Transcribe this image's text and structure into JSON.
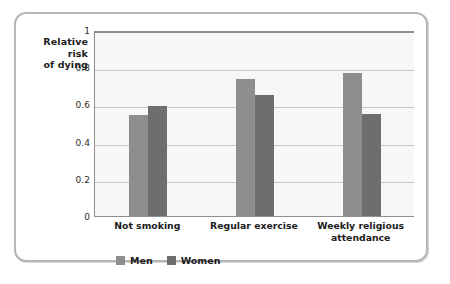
{
  "chart_data": {
    "type": "bar",
    "title": "",
    "xlabel": "",
    "ylabel": "Relative risk of dying",
    "ylabel_lines": [
      "Relative",
      "risk",
      "of dying"
    ],
    "categories": [
      "Not smoking",
      "Regular exercise",
      "Weekly religious attendance"
    ],
    "category_label_lines": [
      [
        "Not smoking"
      ],
      [
        "Regular exercise"
      ],
      [
        "Weekly religious",
        "attendance"
      ]
    ],
    "series": [
      {
        "name": "Men",
        "color": "#8e8e8e",
        "values": [
          0.545,
          0.735,
          0.77
        ]
      },
      {
        "name": "Women",
        "color": "#6e6e6e",
        "values": [
          0.59,
          0.65,
          0.55
        ]
      }
    ],
    "ylim": [
      0,
      1
    ],
    "yticks": [
      0,
      0.2,
      0.4,
      0.6,
      0.8,
      1
    ],
    "ytick_labels": [
      "0",
      "0.2",
      "0.4",
      "0.6",
      "0.8",
      "1"
    ],
    "grid": true,
    "legend_position": "bottom-left",
    "plot_background": "#f7f7f7",
    "gridline_color": "#c9c9c9",
    "axis_color": "#8f8f8f",
    "frame_color": "#b6b6b6"
  }
}
